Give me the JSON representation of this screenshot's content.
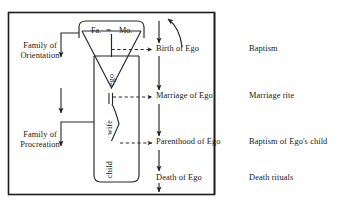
{
  "diagram": {
    "title_hidden": "",
    "frame": {
      "x": 8,
      "y": 12,
      "w": 207,
      "h": 183
    },
    "kin_terms": {
      "father": "Fa.",
      "equals_marriage": "=",
      "mother": "Mo.",
      "ego": "ego",
      "wife": "wife",
      "child": "child"
    },
    "family_labels": [
      {
        "line1": "Family of",
        "line2": "Orientation"
      },
      {
        "line1": "Family of",
        "line2": "Procreation"
      }
    ],
    "life_events": [
      "Birth of Ego",
      "Marriage of Ego",
      "Parenthood of Ego",
      "Death of Ego"
    ],
    "rituals": [
      "Baptism",
      "Marriage rite",
      "Baptism of Ego's child",
      "Death rituals"
    ],
    "colors": {
      "ink": "#1a1a1a",
      "line": "#222222",
      "paper": "#ffffff"
    }
  }
}
